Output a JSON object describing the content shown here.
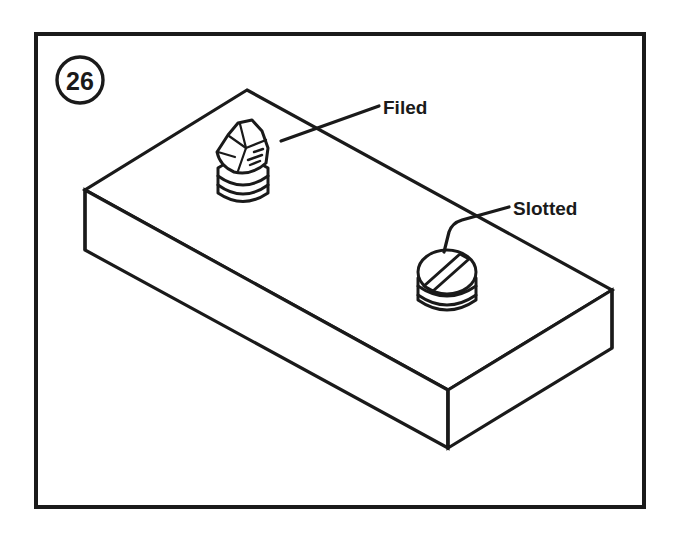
{
  "figure": {
    "badge_number": "26",
    "badge_name": "figure-number-badge",
    "frame_name": "illustration-frame"
  },
  "callouts": [
    {
      "label": "Filed",
      "target": "filed-screw",
      "text_x": 383,
      "text_y": 107,
      "leader_path": "M 281 141 L 379 106"
    },
    {
      "label": "Slotted",
      "target": "slotted-screw",
      "text_x": 513,
      "text_y": 208,
      "leader_path": "M 444 252 L 449 232 Q 452 223 462 220 L 509 207"
    }
  ],
  "block": {
    "name": "workpiece-block",
    "top_face_path": "M 247 90 L 612 290 L 448 390 L 85 190 Z",
    "front_left_face_path": "M 85 190 L 448 390 L 448 448 L 85 250 Z",
    "front_right_face_path": "M 448 390 L 612 290 L 612 348 L 448 448 Z",
    "vertical_edges": [
      "M 85 190 L 85 250",
      "M 448 390 L 448 448",
      "M 612 290 L 612 348"
    ]
  },
  "screws": [
    {
      "name": "filed-screw",
      "condition": "Filed",
      "description": "screw head damaged and rounded off by a file, slot destroyed",
      "center_x": 243,
      "center_y": 165,
      "head_type": "mangled"
    },
    {
      "name": "slotted-screw",
      "condition": "Slotted",
      "description": "intact screw head with usable straight slot",
      "center_x": 447,
      "center_y": 282,
      "head_type": "slotted"
    }
  ],
  "colors": {
    "ink": "#1a1a1a",
    "paper": "#ffffff"
  }
}
